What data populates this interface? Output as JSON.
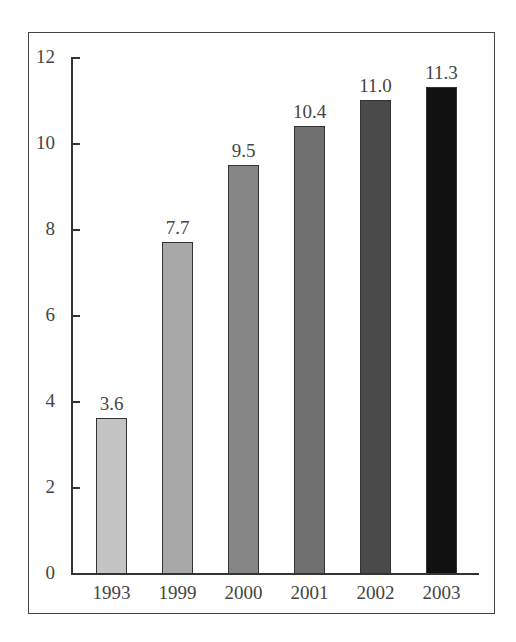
{
  "chart_data": {
    "type": "bar",
    "title": "",
    "xlabel": "",
    "ylabel": "",
    "categories": [
      "1993",
      "1999",
      "2000",
      "2001",
      "2002",
      "2003"
    ],
    "values": [
      3.6,
      7.7,
      9.5,
      10.4,
      11.0,
      11.3
    ],
    "value_labels": [
      "3.6",
      "7.7",
      "9.5",
      "10.4",
      "11.0",
      "11.3"
    ],
    "bar_colors": [
      "#c4c4c4",
      "#a8a8a8",
      "#858585",
      "#707070",
      "#4a4a4a",
      "#111111"
    ],
    "ylim": [
      0,
      12
    ],
    "yticks": [
      "0",
      "2",
      "4",
      "6",
      "8",
      "10",
      "12"
    ],
    "grid": false,
    "legend": null
  }
}
